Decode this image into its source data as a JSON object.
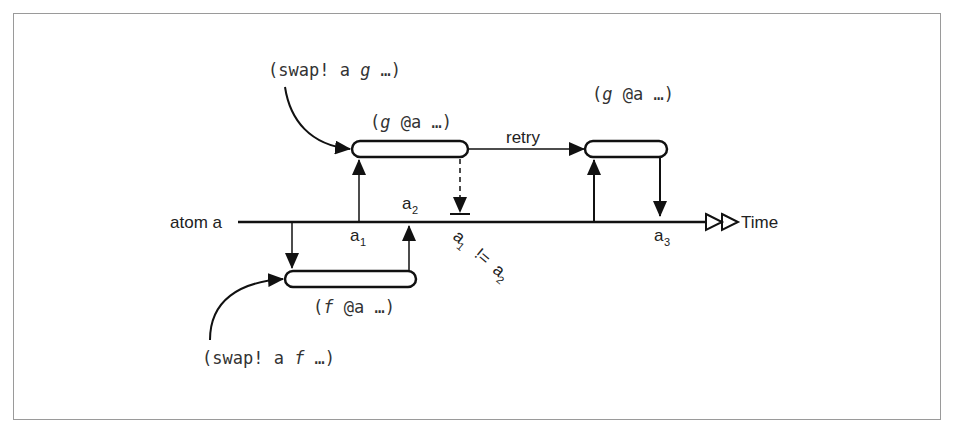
{
  "diagram": {
    "type": "timeline",
    "timeline": {
      "label": "atom a",
      "end_label": "Time"
    },
    "calls": [
      {
        "id": "swap-g",
        "text": "(swap! a g …)",
        "fn": "g"
      },
      {
        "id": "swap-f",
        "text": "(swap! a f …)",
        "fn": "f"
      }
    ],
    "boxes": [
      {
        "id": "g-first",
        "label": "(g @a …)"
      },
      {
        "id": "g-retry",
        "label": "(g @a …)"
      },
      {
        "id": "f-run",
        "label": "(f @a …)"
      }
    ],
    "edges": [
      {
        "id": "retry",
        "label": "retry"
      }
    ],
    "markers": [
      {
        "id": "a1",
        "base": "a",
        "sub": "1"
      },
      {
        "id": "a2",
        "base": "a",
        "sub": "2"
      },
      {
        "id": "a3",
        "base": "a",
        "sub": "3"
      }
    ],
    "inequality": {
      "lhs_base": "a",
      "lhs_sub": "1",
      "op": "!=",
      "rhs_base": "a",
      "rhs_sub": "2"
    },
    "colors": {
      "line": "#111111",
      "border": "#9a9a9a",
      "text": "#333333"
    }
  }
}
